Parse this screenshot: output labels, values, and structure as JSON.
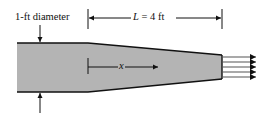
{
  "figure": {
    "type": "tapered-nozzle-diagram",
    "diameter_label": "1-ft diameter",
    "length_label": {
      "symbol": "L",
      "equals": "=",
      "value": "4 ft"
    },
    "position_label": "x",
    "colors": {
      "fill": "#b4b4b4",
      "outline": "#111111",
      "jet_lines": "#555555",
      "background": "#ffffff"
    },
    "jet_streams": 5
  }
}
